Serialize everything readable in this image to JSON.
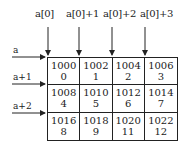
{
  "diagram": {
    "title": "",
    "column_labels": [
      "a[0]",
      "a[0]+1",
      "a[0]+2",
      "a[0]+3"
    ],
    "row_labels": [
      "a",
      "a+1",
      "a+2"
    ],
    "cells": [
      [
        {
          "address": "1000",
          "value": "0"
        },
        {
          "address": "1002",
          "value": "1"
        },
        {
          "address": "1004",
          "value": "2"
        },
        {
          "address": "1006",
          "value": "3"
        }
      ],
      [
        {
          "address": "1008",
          "value": "4"
        },
        {
          "address": "1010",
          "value": "5"
        },
        {
          "address": "1012",
          "value": "6"
        },
        {
          "address": "1014",
          "value": "7"
        }
      ],
      [
        {
          "address": "1016",
          "value": "8"
        },
        {
          "address": "1018",
          "value": "9"
        },
        {
          "address": "1020",
          "value": "11"
        },
        {
          "address": "1022",
          "value": "12"
        }
      ]
    ],
    "colors": {
      "line": "#222222",
      "background": "#ffffff"
    }
  }
}
